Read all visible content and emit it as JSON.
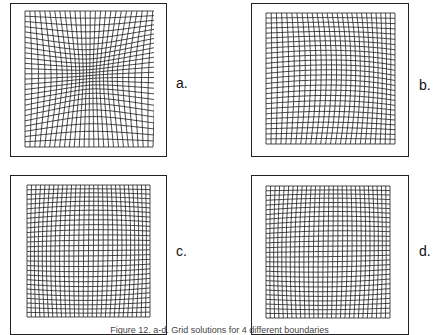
{
  "figure": {
    "caption": "Figure 12. a-d. Grid solutions for 4 different boundaries",
    "panels": [
      {
        "id": "a",
        "label": "a.",
        "lines": 26,
        "warp": "wave"
      },
      {
        "id": "b",
        "label": "b.",
        "lines": 26,
        "warp": "corner-fan"
      },
      {
        "id": "c",
        "label": "c.",
        "lines": 28,
        "warp": "pillow"
      },
      {
        "id": "d",
        "label": "d.",
        "lines": 28,
        "warp": "skew-pillow"
      }
    ]
  }
}
